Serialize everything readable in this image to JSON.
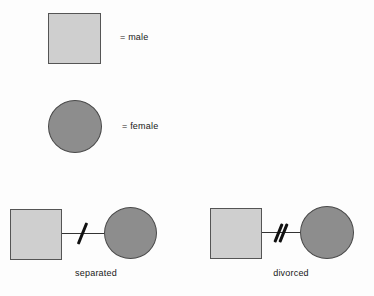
{
  "figure": {
    "kind": "genogram-symbol-legend",
    "background_color": "#fdfdfd",
    "text_color": "#181818"
  },
  "legend": {
    "items": [
      {
        "symbol": "square",
        "symbol_name": "male-symbol",
        "label": "= male",
        "fill": "#cfcfcf",
        "stroke": "#555555"
      },
      {
        "symbol": "circle",
        "symbol_name": "female-symbol",
        "label": "= female",
        "fill": "#8d8d8d",
        "stroke": "#4a4a4a"
      }
    ]
  },
  "relationships": [
    {
      "id": "separated",
      "caption": "separated",
      "left_symbol": "square",
      "right_symbol": "circle",
      "slash_count": 1,
      "line_color": "#333333",
      "slash_color": "#111111"
    },
    {
      "id": "divorced",
      "caption": "divorced",
      "left_symbol": "square",
      "right_symbol": "circle",
      "slash_count": 2,
      "line_color": "#333333",
      "slash_color": "#111111"
    }
  ]
}
